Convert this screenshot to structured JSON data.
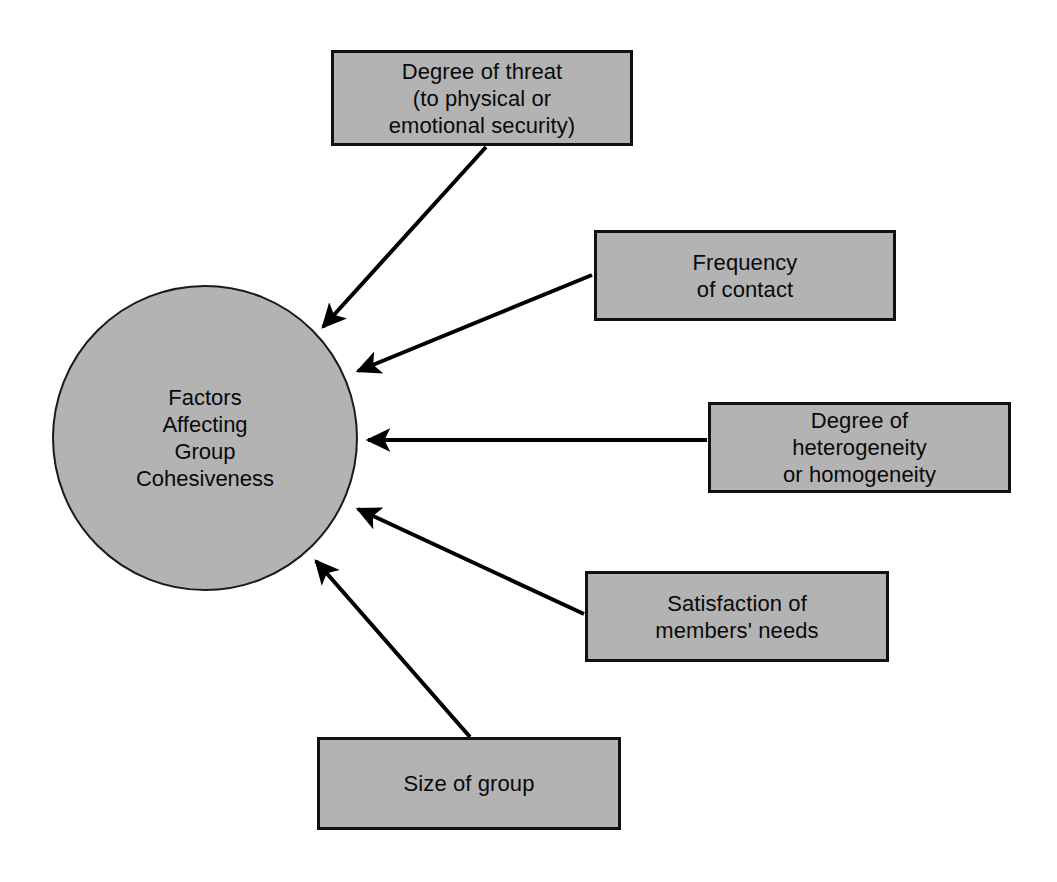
{
  "diagram": {
    "title": "Factors Affecting Group Cohesiveness",
    "type": "hub-and-spoke",
    "colors": {
      "node_fill": "#b3b3b3",
      "node_border": "#111111",
      "connector": "#000000",
      "background": "#ffffff",
      "text": "#0a0a0a"
    },
    "hub": {
      "id": "hub",
      "label": "Factors\nAffecting\nGroup\nCohesiveness",
      "shape": "circle"
    },
    "nodes": [
      {
        "id": "box-threat",
        "label": "Degree of threat\n(to physical or\nemotional security)",
        "shape": "rectangle",
        "position": "top"
      },
      {
        "id": "box-frequency",
        "label": "Frequency\nof contact",
        "shape": "rectangle",
        "position": "upper-right"
      },
      {
        "id": "box-heterogeneity",
        "label": "Degree of\nheterogeneity\nor homogeneity",
        "shape": "rectangle",
        "position": "right"
      },
      {
        "id": "box-satisfaction",
        "label": "Satisfaction of\nmembers' needs",
        "shape": "rectangle",
        "position": "lower-right"
      },
      {
        "id": "box-size",
        "label": "Size of group",
        "shape": "rectangle",
        "position": "bottom"
      }
    ],
    "connectors": [
      {
        "id": "arrow-threat-to-hub",
        "from": "box-threat",
        "to": "hub",
        "style": "single-arrow"
      },
      {
        "id": "arrow-frequency-to-hub",
        "from": "box-frequency",
        "to": "hub",
        "style": "single-arrow"
      },
      {
        "id": "arrow-heterogeneity-to-hub",
        "from": "box-heterogeneity",
        "to": "hub",
        "style": "single-arrow"
      },
      {
        "id": "arrow-satisfaction-to-hub",
        "from": "box-satisfaction",
        "to": "hub",
        "style": "single-arrow"
      },
      {
        "id": "arrow-size-to-hub",
        "from": "box-size",
        "to": "hub",
        "style": "single-arrow"
      }
    ]
  }
}
